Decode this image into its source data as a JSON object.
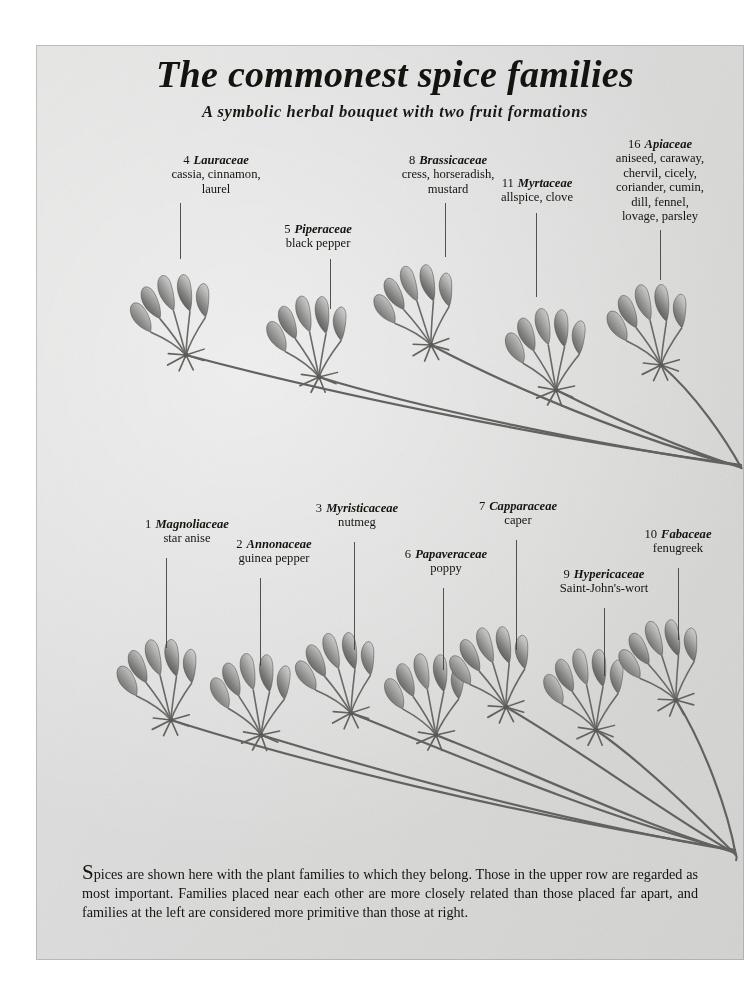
{
  "page": {
    "title": "The commonest spice families",
    "subtitle": "A symbolic herbal bouquet with two fruit formations",
    "caption_dropcap": "S",
    "caption_text": "pices are shown here with the plant families to which they belong. Those in the upper row are regarded as most important. Families placed near each other are more closely related than those placed far apart, and families at the left are considered more primitive than those at right.",
    "background_color": "#dedede",
    "ink_color": "#16140f"
  },
  "upper_row": {
    "labels": [
      {
        "number": "4",
        "family": "Lauraceae",
        "commons": [
          "cassia, cinnamon,",
          "laurel"
        ]
      },
      {
        "number": "5",
        "family": "Piperaceae",
        "commons": [
          "black pepper"
        ]
      },
      {
        "number": "8",
        "family": "Brassicaceae",
        "commons": [
          "cress, horseradish,",
          "mustard"
        ]
      },
      {
        "number": "11",
        "family": "Myrtaceae",
        "commons": [
          "allspice, clove"
        ]
      },
      {
        "number": "16",
        "family": "Apiaceae",
        "commons": [
          "aniseed, caraway,",
          "chervil, cicely,",
          "coriander, cumin,",
          "dill, fennel,",
          "lovage, parsley"
        ]
      }
    ]
  },
  "lower_row": {
    "labels": [
      {
        "number": "1",
        "family": "Magnoliaceae",
        "commons": [
          "star anise"
        ]
      },
      {
        "number": "2",
        "family": "Annonaceae",
        "commons": [
          "guinea pepper"
        ]
      },
      {
        "number": "3",
        "family": "Myristicaceae",
        "commons": [
          "nutmeg"
        ]
      },
      {
        "number": "6",
        "family": "Papaveraceae",
        "commons": [
          "poppy"
        ]
      },
      {
        "number": "7",
        "family": "Capparaceae",
        "commons": [
          "caper"
        ]
      },
      {
        "number": "9",
        "family": "Hypericaceae",
        "commons": [
          "Saint-John's-wort"
        ]
      },
      {
        "number": "10",
        "family": "Fabaceae",
        "commons": [
          "fenugreek"
        ]
      }
    ]
  },
  "illustration": {
    "description": "symbolic herbal bouquet of umbel fruit clusters",
    "upper_row_cluster_count": 5,
    "lower_row_cluster_count": 7
  }
}
